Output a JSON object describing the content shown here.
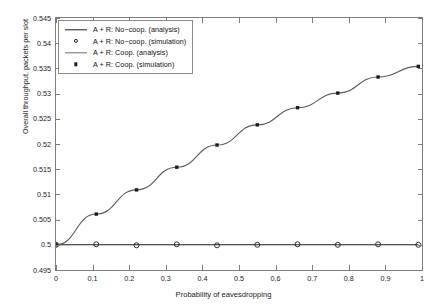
{
  "chart_data": {
    "type": "line",
    "title": "",
    "xlabel": "Probability of eavesdropping",
    "ylabel": "Overall throughput, packets per slot",
    "xlim": [
      0,
      1
    ],
    "ylim": [
      0.495,
      0.545
    ],
    "xticks": [
      "0",
      "0.1",
      "0.2",
      "0.3",
      "0.4",
      "0.5",
      "0.6",
      "0.7",
      "0.8",
      "0.9",
      "1"
    ],
    "xtick_values": [
      0,
      0.1,
      0.2,
      0.3,
      0.4,
      0.5,
      0.6,
      0.7,
      0.8,
      0.9,
      1
    ],
    "yticks": [
      "0.495",
      "0.5",
      "0.505",
      "0.51",
      "0.515",
      "0.52",
      "0.525",
      "0.53",
      "0.535",
      "0.54",
      "0.545"
    ],
    "ytick_values": [
      0.495,
      0.5,
      0.505,
      0.51,
      0.515,
      0.52,
      0.525,
      0.53,
      0.535,
      0.54,
      0.545
    ],
    "grid": false,
    "legend_position": "upper-left",
    "series": [
      {
        "name": "A + R: No-coop. (analysis)",
        "kind": "line",
        "style": "solid",
        "color": "#1c1c1c",
        "x": [
          0,
          0.11,
          0.22,
          0.33,
          0.44,
          0.55,
          0.66,
          0.77,
          0.88,
          0.99
        ],
        "values": [
          0.5,
          0.5,
          0.5,
          0.5,
          0.5,
          0.5,
          0.5,
          0.5,
          0.5,
          0.5
        ]
      },
      {
        "name": "A + R: No-coop. (simulation)",
        "kind": "marker",
        "marker": "open-circle",
        "color": "#1c1c1c",
        "x": [
          0,
          0.11,
          0.22,
          0.33,
          0.44,
          0.55,
          0.66,
          0.77,
          0.88,
          0.99
        ],
        "values": [
          0.5,
          0.5001,
          0.4999,
          0.5001,
          0.4999,
          0.5,
          0.5001,
          0.5,
          0.5001,
          0.5
        ]
      },
      {
        "name": "A + R: Coop. (analysis)",
        "kind": "line",
        "style": "solid",
        "color": "#5a5a5a",
        "x": [
          0,
          0.11,
          0.22,
          0.33,
          0.44,
          0.55,
          0.66,
          0.77,
          0.88,
          0.99
        ],
        "values": [
          0.5,
          0.5061,
          0.5109,
          0.5154,
          0.5198,
          0.5238,
          0.5272,
          0.5301,
          0.5333,
          0.5354
        ]
      },
      {
        "name": "A + R: Coop. (simulation)",
        "kind": "marker",
        "marker": "filled-dot",
        "color": "#1c1c1c",
        "x": [
          0,
          0.11,
          0.22,
          0.33,
          0.44,
          0.55,
          0.66,
          0.77,
          0.88,
          0.99
        ],
        "values": [
          0.5,
          0.5061,
          0.5109,
          0.5154,
          0.5198,
          0.5238,
          0.5272,
          0.5301,
          0.5333,
          0.5354
        ]
      }
    ]
  },
  "legend": {
    "items": [
      {
        "label": "A + R: No−coop. (analysis)",
        "key": "line",
        "color": "#1c1c1c"
      },
      {
        "label": "A + R: No−coop. (simulation)",
        "key": "circle",
        "color": "#1c1c1c"
      },
      {
        "label": "A + R: Coop. (analysis)",
        "key": "line",
        "color": "#5a5a5a"
      },
      {
        "label": "A + R: Coop. (simulation)",
        "key": "dot",
        "color": "#1c1c1c"
      }
    ]
  },
  "axes": {
    "xlabel": "Probability of eavesdropping",
    "ylabel": "Overall throughput, packets per slot"
  },
  "colors": {
    "axis": "#7d7d7d",
    "text": "#1a1a1a",
    "series_dark": "#1c1c1c",
    "series_gray": "#5a5a5a",
    "background": "#ffffff"
  }
}
